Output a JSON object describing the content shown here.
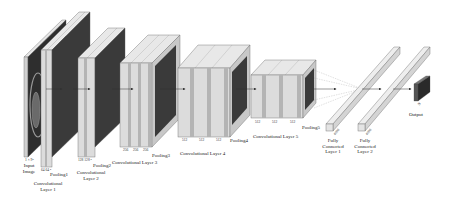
{
  "diagram": {
    "title": "",
    "colors": {
      "background": "#ffffff",
      "conv_face": "#dcdcdc",
      "conv_stripe": "#b4b4b4",
      "conv_top": "#e8e8e8",
      "conv_side": "#c8c8c8",
      "pool_face": "#3a3a3a",
      "edge": "#555555",
      "arrow": "#333333"
    },
    "nodes": [
      {
        "id": "input",
        "label": "Input Image",
        "line1": "Input",
        "line2": "Image",
        "dims": "1 × 9²"
      },
      {
        "id": "conv1",
        "label": "Convolutional Layer 1",
        "line1": "Convolutional",
        "line2": "Layer 1",
        "dims": "64 64 ²"
      },
      {
        "id": "pool1",
        "label": "Pooling1"
      },
      {
        "id": "conv2",
        "label": "Convolutional Layer 2",
        "line1": "Convolutional",
        "line2": "Layer 2",
        "dims": "128 128 ²"
      },
      {
        "id": "pool2",
        "label": "Pooling2"
      },
      {
        "id": "conv3",
        "label": "Convolutional Layer 3",
        "dims": [
          "256",
          "256",
          "256"
        ]
      },
      {
        "id": "pool3",
        "label": "Pooling3"
      },
      {
        "id": "conv4",
        "label": "Convolutional Layer 4",
        "dims": [
          "512",
          "512",
          "512"
        ]
      },
      {
        "id": "pool4",
        "label": "Pooling4"
      },
      {
        "id": "conv5",
        "label": "Convolutional Layer 5",
        "dims": [
          "512",
          "512",
          "512"
        ]
      },
      {
        "id": "pool5",
        "label": "Pooling5"
      },
      {
        "id": "fc1",
        "label": "Fully Connected Layer 1",
        "line1": "Fully",
        "line2": "Connected",
        "line3": "Layer 1",
        "dims": "4096"
      },
      {
        "id": "fc2",
        "label": "Fully Connected Layer 2",
        "line1": "Fully",
        "line2": "Connected",
        "line3": "Layer 2",
        "dims": "4096"
      },
      {
        "id": "output",
        "label": "Output",
        "dims": "N"
      }
    ],
    "edges": [
      [
        "input",
        "conv1"
      ],
      [
        "pool1",
        "conv2"
      ],
      [
        "pool2",
        "conv3"
      ],
      [
        "pool3",
        "conv4"
      ],
      [
        "pool4",
        "conv5"
      ],
      [
        "pool5",
        "fc1"
      ],
      [
        "fc1",
        "fc2"
      ],
      [
        "fc2",
        "output"
      ]
    ]
  }
}
